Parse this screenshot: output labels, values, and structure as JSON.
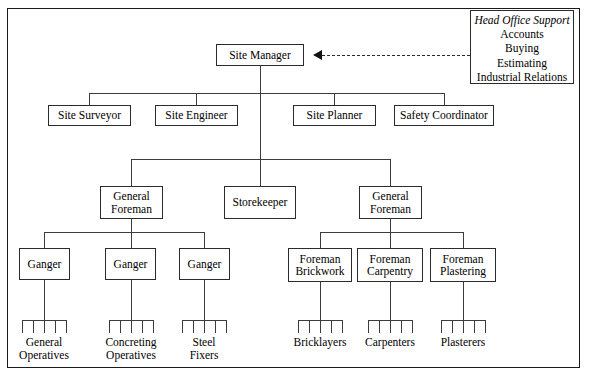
{
  "diagram": {
    "frame_color": "#1a1a1a",
    "line_color": "#3c3c3c"
  },
  "head_office": {
    "title": "Head Office Support",
    "items": [
      "Accounts",
      "Buying",
      "Estimating",
      "Industrial Relations"
    ]
  },
  "nodes": {
    "site_manager": "Site Manager",
    "site_surveyor": "Site Surveyor",
    "site_engineer": "Site Engineer",
    "site_planner": "Site Planner",
    "safety_coordinator": "Safety Coordinator",
    "general_foreman_left_l1": "General",
    "general_foreman_left_l2": "Foreman",
    "storekeeper": "Storekeeper",
    "general_foreman_right_l1": "General",
    "general_foreman_right_l2": "Foreman",
    "ganger_1": "Ganger",
    "ganger_2": "Ganger",
    "ganger_3": "Ganger",
    "foreman_brickwork_l1": "Foreman",
    "foreman_brickwork_l2": "Brickwork",
    "foreman_carpentry_l1": "Foreman",
    "foreman_carpentry_l2": "Carpentry",
    "foreman_plastering_l1": "Foreman",
    "foreman_plastering_l2": "Plastering"
  },
  "leaves": {
    "general_operatives_l1": "General",
    "general_operatives_l2": "Operatives",
    "concreting_operatives_l1": "Concreting",
    "concreting_operatives_l2": "Operatives",
    "steel_fixers_l1": "Steel",
    "steel_fixers_l2": "Fixers",
    "bricklayers": "Bricklayers",
    "carpenters": "Carpenters",
    "plasterers": "Plasterers"
  }
}
